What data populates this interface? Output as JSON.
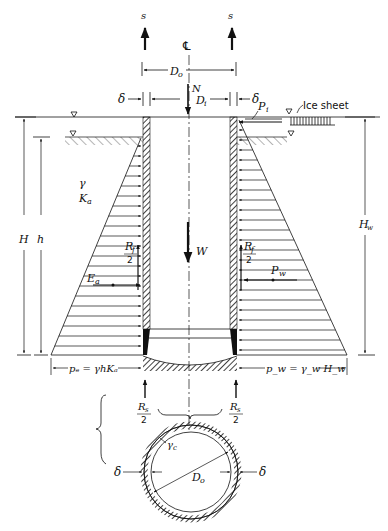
{
  "figure": {
    "type": "caisson/pier free-body diagram",
    "labels": {
      "s_left": "s",
      "s_right": "s",
      "centerline": "℄",
      "outer_diameter": "D",
      "outer_diameter_sub": "o",
      "inner_diameter": "D",
      "inner_diameter_sub": "i",
      "normal_force": "N",
      "wall_thickness_left": "δ",
      "wall_thickness_right": "δ",
      "ice_pressure": "P",
      "ice_pressure_sub": "i",
      "ice_sheet": "Ice sheet",
      "soil_unit_weight": "γ",
      "active_coeff": "K",
      "active_coeff_sub": "a",
      "total_height": "H",
      "soil_height": "h",
      "water_height": "H",
      "water_height_sub": "w",
      "weight": "W",
      "friction_left_num": "R",
      "friction_left_sub": "f",
      "friction_left_den": "2",
      "friction_right_num": "R",
      "friction_right_sub": "f",
      "friction_right_den": "2",
      "earth_force": "E",
      "earth_force_sub": "a",
      "water_force": "P",
      "water_force_sub": "w",
      "earth_pressure_formula": "pₑ = γhKₐ",
      "water_pressure_formula": "p_w = γ_w H_w",
      "base_reaction_left_num": "R",
      "base_reaction_left_sub": "s",
      "base_reaction_left_den": "2",
      "base_reaction_right_num": "R",
      "base_reaction_right_sub": "s",
      "base_reaction_right_den": "2",
      "section_delta_left": "δ",
      "section_delta_right": "δ",
      "section_diameter": "D",
      "section_diameter_sub": "o",
      "concrete_unit_weight": "γ",
      "concrete_unit_weight_sub": "c"
    }
  }
}
